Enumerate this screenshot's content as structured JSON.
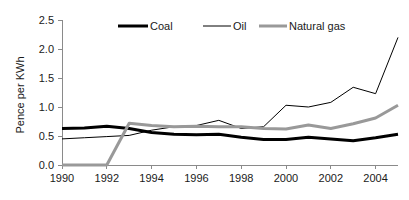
{
  "chart_data": {
    "type": "line",
    "title": "",
    "subtitle": "",
    "xlabel": "",
    "ylabel": "Pence per KWh",
    "x": [
      1990,
      1991,
      1992,
      1993,
      1994,
      1995,
      1996,
      1997,
      1998,
      1999,
      2000,
      2001,
      2002,
      2003,
      2004,
      2005
    ],
    "xlim": [
      1990,
      2005
    ],
    "ylim": [
      0.0,
      2.5
    ],
    "xticks": [
      1990,
      1992,
      1994,
      1996,
      1998,
      2000,
      2002,
      2004
    ],
    "xtick_labels": [
      "1990",
      "1992",
      "1994",
      "1996",
      "1998",
      "2000",
      "2002",
      "2004"
    ],
    "yticks": [
      0.0,
      0.5,
      1.0,
      1.5,
      2.0,
      2.5
    ],
    "ytick_labels": [
      "0.0",
      "0.5",
      "1.0",
      "1.5",
      "2.0",
      "2.5"
    ],
    "grid": false,
    "legend_position": "top-center",
    "series": [
      {
        "name": "Coal",
        "color": "#000000",
        "width": 3,
        "values": [
          0.63,
          0.64,
          0.67,
          0.63,
          0.56,
          0.53,
          0.52,
          0.53,
          0.48,
          0.44,
          0.44,
          0.48,
          0.45,
          0.42,
          0.47,
          0.53
        ]
      },
      {
        "name": "Oil",
        "color": "#000000",
        "width": 1,
        "values": [
          0.45,
          0.47,
          0.49,
          0.51,
          0.6,
          0.66,
          0.68,
          0.77,
          0.63,
          0.66,
          1.03,
          1.0,
          1.08,
          1.34,
          1.23,
          2.2
        ]
      },
      {
        "name": "Natural gas",
        "color": "#999999",
        "width": 3,
        "values": [
          0.0,
          0.0,
          0.0,
          0.72,
          0.68,
          0.66,
          0.67,
          0.66,
          0.66,
          0.63,
          0.62,
          0.69,
          0.63,
          0.71,
          0.81,
          1.03
        ]
      }
    ]
  },
  "legend": {
    "items": [
      {
        "label": "Coal"
      },
      {
        "label": "Oil"
      },
      {
        "label": "Natural gas"
      }
    ]
  },
  "axes": {
    "y_title": "Pence per KWh"
  }
}
